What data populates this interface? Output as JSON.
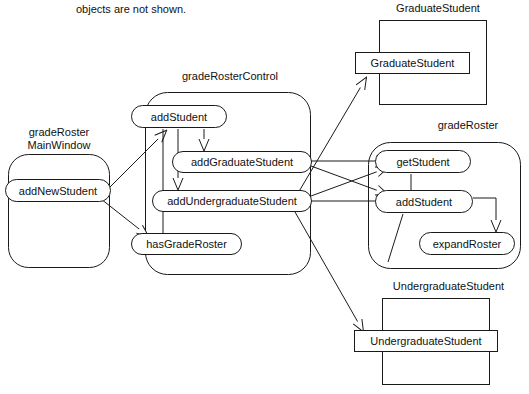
{
  "diagram": {
    "type": "uml-package-collaboration",
    "caption": "objects are not shown.",
    "stroke_color": "#1a1a1a",
    "fill_color": "#ffffff",
    "background": "#ffffff"
  },
  "packages": {
    "main_window": {
      "label": "gradeRoster\nMainWindow",
      "shape": "rounded-rectangle",
      "operations": [
        {
          "name": "addNewStudent",
          "label": "addNewStudent"
        }
      ]
    },
    "control": {
      "label": "gradeRosterControl",
      "shape": "rounded-rectangle",
      "operations": [
        {
          "name": "addStudent",
          "label": "addStudent"
        },
        {
          "name": "addGraduateStudent",
          "label": "addGraduateStudent"
        },
        {
          "name": "addUndergraduateStudent",
          "label": "addUndergraduateStudent"
        },
        {
          "name": "hasGradeRoster",
          "label": "hasGradeRoster"
        }
      ]
    },
    "grade_roster": {
      "label": "gradeRoster",
      "shape": "rounded-rectangle",
      "operations": [
        {
          "name": "getStudent",
          "label": "getStudent"
        },
        {
          "name": "addStudent",
          "label": "addStudent"
        },
        {
          "name": "expandRoster",
          "label": "expandRoster"
        }
      ]
    },
    "graduate_student": {
      "label": "GraduateStudent",
      "shape": "rectangle",
      "classes": [
        {
          "name": "GraduateStudent",
          "label": "GraduateStudent"
        }
      ]
    },
    "undergraduate_student": {
      "label": "UndergraduateStudent",
      "shape": "rectangle",
      "classes": [
        {
          "name": "UndergraduateStudent",
          "label": "UndergraduateStudent"
        }
      ]
    }
  },
  "messages": [
    {
      "from": "addNewStudent",
      "to": "addStudent (control)",
      "style": "open-arrow"
    },
    {
      "from": "addNewStudent",
      "to": "hasGradeRoster",
      "style": "open-arrow"
    },
    {
      "from": "addStudent (control)",
      "to": "addGraduateStudent",
      "style": "open-arrow"
    },
    {
      "from": "addStudent (control)",
      "to": "addUndergraduateStudent",
      "style": "open-arrow"
    },
    {
      "from": "addStudent (control)",
      "to": "hasGradeRoster",
      "style": "plain-line"
    },
    {
      "from": "addGraduateStudent",
      "to": "GraduateStudent",
      "style": "open-arrow"
    },
    {
      "from": "addGraduateStudent",
      "to": "getStudent",
      "style": "open-arrow"
    },
    {
      "from": "addGraduateStudent",
      "to": "addStudent (gradeRoster)",
      "style": "open-arrow"
    },
    {
      "from": "addUndergraduateStudent",
      "to": "getStudent",
      "style": "open-arrow"
    },
    {
      "from": "addUndergraduateStudent",
      "to": "addStudent (gradeRoster)",
      "style": "open-arrow"
    },
    {
      "from": "addUndergraduateStudent",
      "to": "UndergraduateStudent",
      "style": "open-arrow"
    },
    {
      "from": "addStudent (gradeRoster)",
      "to": "expandRoster",
      "style": "open-arrow"
    }
  ]
}
